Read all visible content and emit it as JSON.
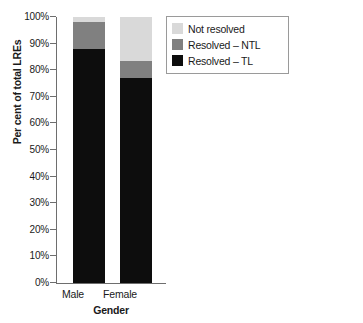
{
  "chart_data": {
    "type": "bar",
    "title": "",
    "subtitle": "",
    "xlabel": "Gender",
    "ylabel": "Per cent of total LREs",
    "categories": [
      "Male",
      "Female"
    ],
    "ylim": [
      0,
      100
    ],
    "y_ticks": [
      "0%",
      "10%",
      "20%",
      "30%",
      "40%",
      "50%",
      "60%",
      "70%",
      "80%",
      "90%",
      "100%"
    ],
    "y_tick_values": [
      0,
      10,
      20,
      30,
      40,
      50,
      60,
      70,
      80,
      90,
      100
    ],
    "grid": false,
    "stacked": true,
    "legend_position": "top-right",
    "series": [
      {
        "name": "Not resolved",
        "color": "#d9d9d9",
        "values": [
          2.0,
          16.5
        ]
      },
      {
        "name": "Resolved – NTL",
        "color": "#808080",
        "values": [
          10.0,
          6.5
        ]
      },
      {
        "name": "Resolved – TL",
        "color": "#0d0d0d",
        "values": [
          88.0,
          77.0
        ]
      }
    ],
    "annotations": []
  },
  "legend": {
    "items": [
      {
        "label": "Not resolved",
        "color": "#d9d9d9"
      },
      {
        "label": "Resolved – NTL",
        "color": "#808080"
      },
      {
        "label": "Resolved – TL",
        "color": "#0d0d0d"
      }
    ]
  },
  "axes": {
    "y_title": "Per cent of total LREs",
    "x_title": "Gender",
    "x_labels": [
      "Male",
      "Female"
    ],
    "y_labels": [
      "100%",
      "90%",
      "80%",
      "70%",
      "60%",
      "50%",
      "40%",
      "30%",
      "20%",
      "10%",
      "0%"
    ]
  },
  "colors": {
    "axis": "#6e6e6e",
    "text": "#1a1a1a",
    "background": "#ffffff",
    "legend_border": "#9a9a9a"
  }
}
